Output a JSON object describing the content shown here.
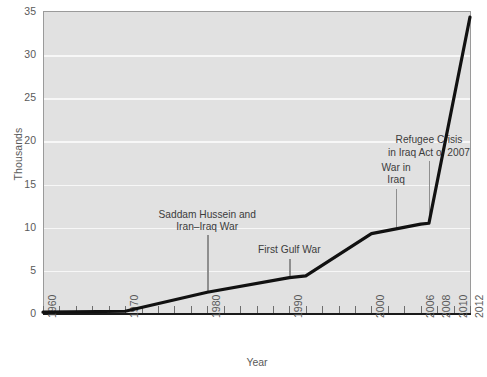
{
  "chart_data": {
    "type": "line",
    "title": "",
    "xlabel": "Year",
    "ylabel": "Thousands",
    "xlim": [
      1960,
      2012
    ],
    "ylim": [
      0,
      35
    ],
    "grid": true,
    "legend": "none",
    "series": [
      {
        "name": "Iraqi refugees admitted (thousands)",
        "color": "#111111",
        "x": [
          1960,
          1970,
          1980,
          1990,
          1992,
          2000,
          2006,
          2007,
          2012
        ],
        "values": [
          0.1,
          0.2,
          2.4,
          4.1,
          4.3,
          9.2,
          10.3,
          10.4,
          34.3
        ]
      }
    ],
    "y_ticks": [
      0,
      5,
      10,
      15,
      20,
      25,
      30,
      35
    ],
    "x_ticks": [
      1960,
      1970,
      1980,
      1990,
      2000,
      2006,
      2008,
      2010,
      2012
    ],
    "x_minor_tick_step": 2,
    "annotations": [
      {
        "id": "saddam-hussein-iran-iraq-war",
        "lines": [
          "Saddam Hussein and",
          "Iran–Iraq War"
        ],
        "year": 1980,
        "leader_top_value": 9.0,
        "leader_bottom_value": 2.4
      },
      {
        "id": "first-gulf-war",
        "lines": [
          "First Gulf War"
        ],
        "year": 1990,
        "leader_top_value": 6.3,
        "leader_bottom_value": 4.1
      },
      {
        "id": "war-in-iraq",
        "lines": [
          "War in",
          "Iraq"
        ],
        "year": 2003,
        "leader_top_value": 14.4,
        "leader_bottom_value": 9.6
      },
      {
        "id": "refugee-crisis-in-iraq-act-of-2007",
        "lines": [
          "Refugee Crisis",
          "in Iraq Act of 2007"
        ],
        "year": 2007,
        "leader_top_value": 17.6,
        "leader_bottom_value": 10.4
      }
    ]
  },
  "colors": {
    "plot_background": "#e1e1e1",
    "gridline": "#f7f7f7",
    "series_line": "#111111",
    "axis": "#1a1a1a",
    "text": "#5a5a5a",
    "annotation_text": "#3c3c3c",
    "leader_line": "#8e8e8e",
    "page_background": "#ffffff"
  }
}
